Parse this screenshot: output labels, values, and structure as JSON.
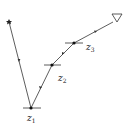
{
  "diagram": {
    "colors": {
      "line": "#333333",
      "background": "#ffffff"
    },
    "start": {
      "x": 9,
      "y": 22,
      "icon": "star-icon"
    },
    "end": {
      "x": 117,
      "y": 18,
      "icon": "triangle-icon"
    },
    "nodes": [
      {
        "id": "z1",
        "x": 31,
        "y": 108,
        "label": "z",
        "sub": "1",
        "lx": 27,
        "ly": 124
      },
      {
        "id": "z2",
        "x": 52,
        "y": 65,
        "label": "z",
        "sub": "2",
        "lx": 58,
        "ly": 83
      },
      {
        "id": "z3",
        "x": 74,
        "y": 43,
        "label": "z",
        "sub": "3",
        "lx": 86,
        "ly": 52
      }
    ],
    "labels": {
      "z1": "z",
      "z1_sub": "1",
      "z2": "z",
      "z2_sub": "2",
      "z3": "z",
      "z3_sub": "3"
    }
  }
}
